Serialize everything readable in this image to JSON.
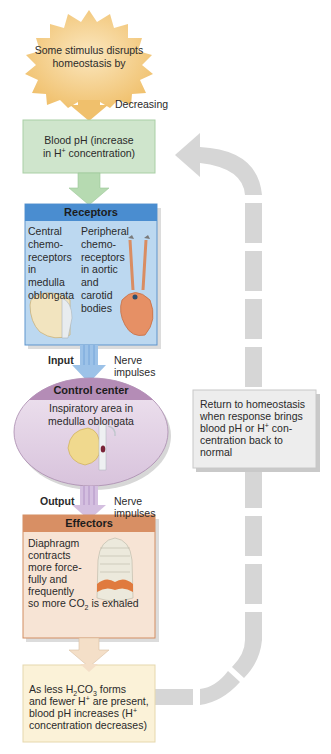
{
  "stimulus": {
    "text": "Some stimulus disrupts homeostasis by",
    "line1": "Some stimulus disrupts",
    "line2": "homeostasis by",
    "arrow_label": "Decreasing",
    "color": "#f2c77a"
  },
  "variable": {
    "line1": "Blood pH (increase",
    "line2_pre": "in H",
    "line2_sup": "+",
    "line2_post": " concentration)",
    "color": "#cfe5cc"
  },
  "receptors": {
    "title": "Receptors",
    "central": [
      "Central",
      "chemo-",
      "receptors",
      "in",
      "medulla",
      "oblongata"
    ],
    "peripheral": [
      "Peripheral",
      "chemo-",
      "receptors",
      "in aortic",
      "and",
      "carotid",
      "bodies"
    ],
    "header_color": "#4b8fd1",
    "body_color": "#b9d6ef"
  },
  "input": {
    "label": "Input",
    "description_line1": "Nerve",
    "description_line2": "impulses"
  },
  "control_center": {
    "title": "Control center",
    "line1": "Inspiratory area in",
    "line2": "medulla oblongata",
    "header_color": "#b48db6",
    "body_color": "#e6d8ea"
  },
  "output": {
    "label": "Output",
    "description_line1": "Nerve",
    "description_line2": "impulses"
  },
  "effectors": {
    "title": "Effectors",
    "lines": [
      "Diaphragm",
      "contracts",
      "more force-",
      "fully and",
      "frequently"
    ],
    "last_pre": "so more CO",
    "last_sub": "2",
    "last_post": " is exhaled",
    "header_color": "#d9936a",
    "body_color": "#f6e3d4"
  },
  "response": {
    "l1_pre": "As less H",
    "l1_sub1": "2",
    "l1_mid": "CO",
    "l1_sub2": "3",
    "l1_post": " forms",
    "l2_pre": "and fewer H",
    "l2_sup": "+",
    "l2_post": " are present,",
    "l3_pre": "blood pH increases (H",
    "l3_sup": "+",
    "l4": "concentration decreases)",
    "color": "#fbf2d9"
  },
  "return": {
    "line1": "Return to homeostasis",
    "line2": "when response brings",
    "line3_pre": "blood pH or H",
    "line3_sup": "+",
    "line3_post": " con-",
    "line4": "centration back to",
    "line5": "normal",
    "path_color": "#d4d4d4",
    "box_color": "#ebebeb"
  }
}
